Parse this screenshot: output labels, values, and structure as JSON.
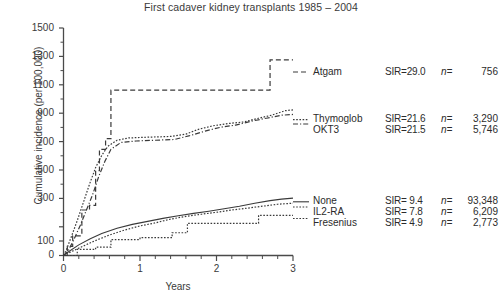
{
  "title": {
    "main": "First cadaver kidney transplants 1985 – 2004",
    "clipped_above": "cumulative incidence of non-melanoma skin cancer"
  },
  "axes": {
    "ylabel": "Cumulative incidence (per 100,000)",
    "xlabel": "Years",
    "yticks": [
      "0",
      "100",
      "300",
      "500",
      "700",
      "900",
      "1100",
      "1300",
      "1500"
    ],
    "xticks": [
      "0",
      "1",
      "2",
      "3"
    ]
  },
  "legend": {
    "atgam": "Atgam",
    "thymoglob": "Thymoglob",
    "okt3": "OKT3",
    "none": "None",
    "il2ra": "IL2-RA",
    "fresenius": "Fresenius"
  },
  "stats": {
    "atgam": {
      "sir": "SIR=29.0",
      "nlabel": "n=",
      "n": "756"
    },
    "thymoglob": {
      "sir": "SIR=21.6",
      "nlabel": "n=",
      "n": "3,290"
    },
    "okt3": {
      "sir": "SIR=21.5",
      "nlabel": "n=",
      "n": "5,746"
    },
    "none": {
      "sir": "SIR= 9.4",
      "nlabel": "n=",
      "n": "93,348"
    },
    "il2ra": {
      "sir": "SIR= 7.8",
      "nlabel": "n=",
      "n": "6,209"
    },
    "fresenius": {
      "sir": "SIR= 4.9",
      "nlabel": "n=",
      "n": "2,773"
    }
  },
  "colors": {
    "ink": "#2b2b2b",
    "axis": "#4a4a4a",
    "curve": "#3a3a3a"
  },
  "chart_data": {
    "type": "line",
    "title": "First cadaver kidney transplants 1985 – 2004",
    "xlabel": "Years",
    "ylabel": "Cumulative incidence (per 100,000)",
    "xlim": [
      0,
      3
    ],
    "ylim": [
      0,
      1500
    ],
    "ytick_values": [
      0,
      100,
      300,
      500,
      700,
      900,
      1100,
      1300,
      1500
    ],
    "xtick_values": [
      0,
      1,
      2,
      3
    ],
    "grid": false,
    "legend_position": "right-of-plot-at-curve-ends",
    "series": [
      {
        "name": "Atgam",
        "style": "dashed",
        "sir": 29.0,
        "n": 756,
        "points": [
          [
            0.0,
            0
          ],
          [
            0.05,
            0
          ],
          [
            0.05,
            60
          ],
          [
            0.12,
            60
          ],
          [
            0.12,
            130
          ],
          [
            0.24,
            130
          ],
          [
            0.24,
            300
          ],
          [
            0.34,
            300
          ],
          [
            0.34,
            330
          ],
          [
            0.42,
            330
          ],
          [
            0.42,
            560
          ],
          [
            0.47,
            560
          ],
          [
            0.47,
            700
          ],
          [
            0.55,
            700
          ],
          [
            0.55,
            770
          ],
          [
            0.62,
            770
          ],
          [
            0.62,
            1090
          ],
          [
            2.7,
            1090
          ],
          [
            2.7,
            1290
          ],
          [
            3.0,
            1290
          ]
        ]
      },
      {
        "name": "Thymoglob",
        "style": "dotted",
        "sir": 21.6,
        "n": 3290,
        "points": [
          [
            0.0,
            0
          ],
          [
            0.04,
            40
          ],
          [
            0.1,
            120
          ],
          [
            0.18,
            230
          ],
          [
            0.26,
            350
          ],
          [
            0.34,
            470
          ],
          [
            0.42,
            580
          ],
          [
            0.5,
            660
          ],
          [
            0.58,
            720
          ],
          [
            0.7,
            760
          ],
          [
            0.85,
            775
          ],
          [
            1.1,
            780
          ],
          [
            1.4,
            785
          ],
          [
            1.6,
            800
          ],
          [
            1.75,
            830
          ],
          [
            1.95,
            855
          ],
          [
            2.15,
            870
          ],
          [
            2.35,
            880
          ],
          [
            2.55,
            905
          ],
          [
            2.72,
            925
          ],
          [
            2.9,
            955
          ],
          [
            3.0,
            960
          ]
        ]
      },
      {
        "name": "OKT3",
        "style": "dash-dot",
        "sir": 21.5,
        "n": 5746,
        "points": [
          [
            0.0,
            0
          ],
          [
            0.06,
            30
          ],
          [
            0.14,
            110
          ],
          [
            0.22,
            200
          ],
          [
            0.3,
            300
          ],
          [
            0.38,
            400
          ],
          [
            0.46,
            520
          ],
          [
            0.54,
            620
          ],
          [
            0.62,
            700
          ],
          [
            0.75,
            745
          ],
          [
            0.95,
            755
          ],
          [
            1.2,
            760
          ],
          [
            1.45,
            765
          ],
          [
            1.65,
            790
          ],
          [
            1.85,
            820
          ],
          [
            2.05,
            845
          ],
          [
            2.25,
            860
          ],
          [
            2.45,
            885
          ],
          [
            2.65,
            905
          ],
          [
            2.85,
            925
          ],
          [
            3.0,
            930
          ]
        ]
      },
      {
        "name": "None",
        "style": "solid",
        "sir": 9.4,
        "n": 93348,
        "points": [
          [
            0.0,
            0
          ],
          [
            0.08,
            30
          ],
          [
            0.2,
            70
          ],
          [
            0.35,
            110
          ],
          [
            0.5,
            145
          ],
          [
            0.7,
            180
          ],
          [
            0.9,
            205
          ],
          [
            1.1,
            225
          ],
          [
            1.3,
            245
          ],
          [
            1.5,
            262
          ],
          [
            1.7,
            278
          ],
          [
            1.9,
            292
          ],
          [
            2.1,
            308
          ],
          [
            2.3,
            325
          ],
          [
            2.5,
            345
          ],
          [
            2.7,
            362
          ],
          [
            2.85,
            372
          ],
          [
            3.0,
            378
          ]
        ]
      },
      {
        "name": "IL2-RA",
        "style": "dotted",
        "sir": 7.8,
        "n": 6209,
        "points": [
          [
            0.0,
            0
          ],
          [
            0.1,
            25
          ],
          [
            0.25,
            60
          ],
          [
            0.4,
            95
          ],
          [
            0.6,
            135
          ],
          [
            0.8,
            168
          ],
          [
            1.0,
            195
          ],
          [
            1.2,
            215
          ],
          [
            1.4,
            240
          ],
          [
            1.6,
            258
          ],
          [
            1.8,
            272
          ],
          [
            2.0,
            285
          ],
          [
            2.2,
            300
          ],
          [
            2.4,
            312
          ],
          [
            2.6,
            325
          ],
          [
            2.8,
            338
          ],
          [
            3.0,
            345
          ]
        ]
      },
      {
        "name": "Fresenius",
        "style": "dotted-step",
        "sir": 4.9,
        "n": 2773,
        "points": [
          [
            0.0,
            0
          ],
          [
            0.18,
            0
          ],
          [
            0.18,
            40
          ],
          [
            0.42,
            40
          ],
          [
            0.42,
            55
          ],
          [
            0.62,
            55
          ],
          [
            0.62,
            105
          ],
          [
            1.0,
            105
          ],
          [
            1.0,
            118
          ],
          [
            1.42,
            118
          ],
          [
            1.42,
            150
          ],
          [
            1.62,
            150
          ],
          [
            1.62,
            212
          ],
          [
            2.55,
            212
          ],
          [
            2.55,
            265
          ],
          [
            3.0,
            265
          ]
        ]
      }
    ]
  }
}
